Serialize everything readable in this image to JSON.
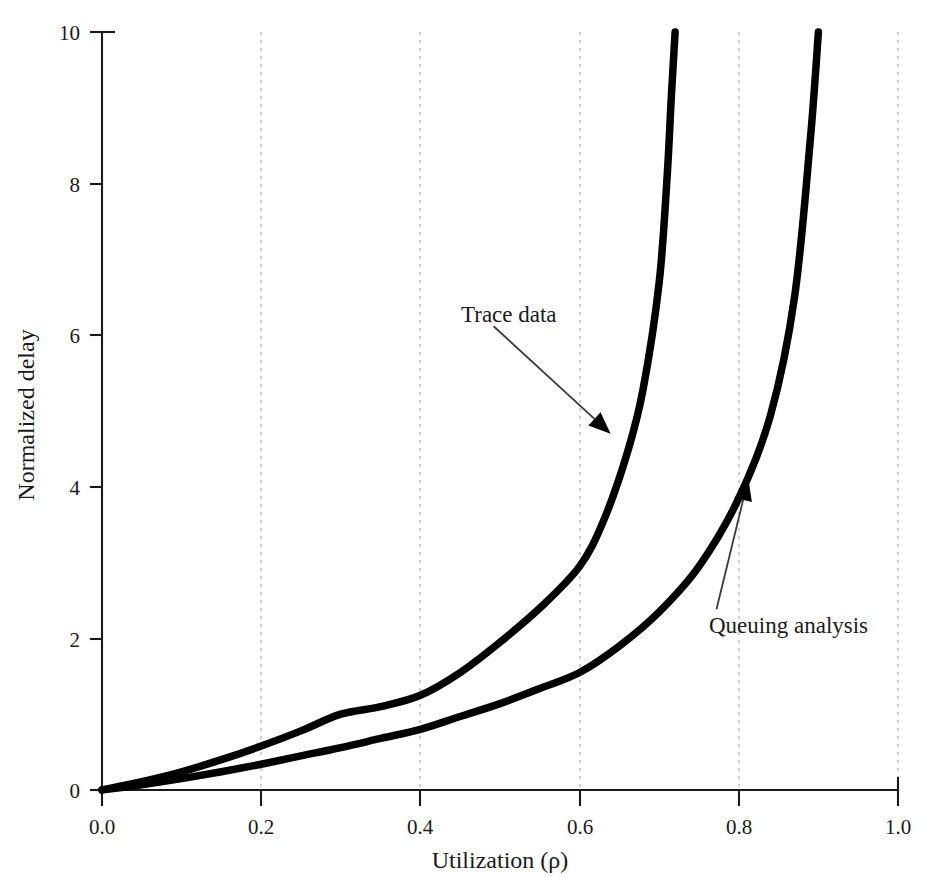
{
  "chart_data": {
    "type": "line",
    "title": "",
    "xlabel": "Utilization (ρ)",
    "ylabel": "Normalized delay",
    "xlim": [
      0.0,
      1.0
    ],
    "ylim": [
      0,
      10
    ],
    "grid": "vertical-dashed",
    "legend": "none (inline annotations with arrows)",
    "xticks": [
      "0.0",
      "0.2",
      "0.4",
      "0.6",
      "0.8",
      "1.0"
    ],
    "xtick_values": [
      0.0,
      0.2,
      0.4,
      0.6,
      0.8,
      1.0
    ],
    "yticks": [
      "0",
      "2",
      "4",
      "6",
      "8",
      "10"
    ],
    "ytick_values": [
      0,
      2,
      4,
      6,
      8,
      10
    ],
    "series": [
      {
        "name": "Trace data",
        "color": "#000000",
        "x": [
          0.0,
          0.05,
          0.1,
          0.15,
          0.2,
          0.25,
          0.3,
          0.35,
          0.4,
          0.45,
          0.5,
          0.55,
          0.6,
          0.63,
          0.66,
          0.68,
          0.7,
          0.71,
          0.715,
          0.72
        ],
        "values": [
          0.0,
          0.11,
          0.24,
          0.4,
          0.58,
          0.78,
          1.0,
          1.1,
          1.25,
          1.55,
          1.95,
          2.4,
          2.95,
          3.55,
          4.45,
          5.3,
          6.7,
          8.1,
          9.1,
          10.0
        ]
      },
      {
        "name": "Queuing analysis",
        "color": "#000000",
        "x": [
          0.0,
          0.05,
          0.1,
          0.15,
          0.2,
          0.25,
          0.3,
          0.35,
          0.4,
          0.45,
          0.5,
          0.55,
          0.6,
          0.65,
          0.7,
          0.75,
          0.8,
          0.84,
          0.87,
          0.89,
          0.9
        ],
        "values": [
          0.0,
          0.07,
          0.15,
          0.24,
          0.34,
          0.45,
          0.56,
          0.68,
          0.8,
          0.97,
          1.14,
          1.34,
          1.55,
          1.9,
          2.35,
          2.95,
          3.85,
          4.95,
          6.5,
          8.6,
          10.0
        ]
      }
    ],
    "annotations": [
      {
        "text": "Trace data",
        "series": "Trace data",
        "label_x": 0.492,
        "label_y": 6.25,
        "point_x": 0.639,
        "point_y": 4.7
      },
      {
        "text": "Queuing analysis",
        "series": "Queuing analysis",
        "label_x": 0.772,
        "label_y": 2.12,
        "point_x": 0.812,
        "point_y": 4.11
      }
    ]
  }
}
